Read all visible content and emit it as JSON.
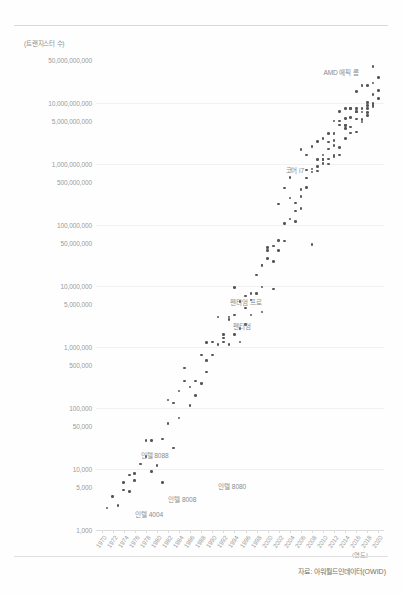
{
  "chart_data": {
    "type": "scatter",
    "title": "",
    "ylabel": "(트랜지스터 수)",
    "xlabel": "(연도)",
    "source": "자료: 아워월드인데이터(OWID)",
    "yscale": "log",
    "ylim": [
      1000,
      50000000000
    ],
    "xlim": [
      1969,
      2021
    ],
    "grid": true,
    "legend": "none",
    "ytick_labels": [
      "50,000,000,000",
      "10,000,000,000",
      "5,000,000,000",
      "1,000,000,000",
      "500,000,000",
      "100,000,000",
      "50,000,000",
      "10,000,000",
      "5,000,000",
      "1,000,000",
      "500,000",
      "100,000",
      "50,000",
      "10,000",
      "5,000",
      "1,000"
    ],
    "ytick_values": [
      50000000000,
      10000000000,
      5000000000,
      1000000000,
      500000000,
      100000000,
      50000000,
      10000000,
      5000000,
      1000000,
      500000,
      100000,
      50000,
      10000,
      5000,
      1000
    ],
    "gridline_values": [
      10000000000,
      1000000000,
      100000000,
      10000000,
      1000000,
      100000,
      10000,
      1000
    ],
    "xtick_labels": [
      "1970",
      "1972",
      "1974",
      "1976",
      "1978",
      "1980",
      "1982",
      "1984",
      "1986",
      "1988",
      "1990",
      "1992",
      "1994",
      "1996",
      "1998",
      "2000",
      "2002",
      "2004",
      "2006",
      "2008",
      "2010",
      "2012",
      "2014",
      "2016",
      "2018",
      "2020"
    ],
    "xtick_values": [
      1970,
      1972,
      1974,
      1976,
      1978,
      1980,
      1982,
      1984,
      1986,
      1988,
      1990,
      1992,
      1994,
      1996,
      1998,
      2000,
      2002,
      2004,
      2006,
      2008,
      2010,
      2012,
      2014,
      2016,
      2018,
      2020
    ],
    "annotations": [
      {
        "label": "AMD 에픽 롬",
        "x": 2019,
        "y": 32000000000,
        "align": "right",
        "dx": -14,
        "dy": 0
      },
      {
        "label": "코어 i7",
        "x": 2008,
        "y": 780000000,
        "align": "right",
        "dx": -8,
        "dy": 0
      },
      {
        "label": "펜티엄 프로",
        "x": 2000,
        "y": 5500000,
        "align": "right",
        "dx": -6,
        "dy": 0
      },
      {
        "label": "펜티엄",
        "x": 1998,
        "y": 2200000,
        "align": "right",
        "dx": -6,
        "dy": 0
      },
      {
        "label": "인텔 8088",
        "x": 1976,
        "y": 17000,
        "align": "left",
        "dx": 6,
        "dy": 0
      },
      {
        "label": "인텔 8080",
        "x": 1990,
        "y": 5200,
        "align": "left",
        "dx": 6,
        "dy": 0
      },
      {
        "label": "인텔 8008",
        "x": 1981,
        "y": 3200,
        "align": "left",
        "dx": 6,
        "dy": 0
      },
      {
        "label": "인텔 4004",
        "x": 1975,
        "y": 1800,
        "align": "left",
        "dx": 6,
        "dy": 0
      }
    ],
    "points": [
      [
        1971,
        2300
      ],
      [
        1972,
        3500
      ],
      [
        1974,
        4500
      ],
      [
        1974,
        6000
      ],
      [
        1975,
        8000
      ],
      [
        1976,
        6500
      ],
      [
        1978,
        29000
      ],
      [
        1979,
        29000
      ],
      [
        1979,
        9000
      ],
      [
        1980,
        11500
      ],
      [
        1981,
        6000
      ],
      [
        1982,
        134000
      ],
      [
        1982,
        55000
      ],
      [
        1983,
        22000
      ],
      [
        1984,
        190000
      ],
      [
        1985,
        275000
      ],
      [
        1986,
        110000
      ],
      [
        1987,
        160000
      ],
      [
        1988,
        250000
      ],
      [
        1988,
        730000
      ],
      [
        1989,
        1180000
      ],
      [
        1989,
        600000
      ],
      [
        1990,
        1200000
      ],
      [
        1991,
        1100000
      ],
      [
        1992,
        1200000
      ],
      [
        1993,
        3100000
      ],
      [
        1993,
        2800000
      ],
      [
        1994,
        1600000
      ],
      [
        1994,
        9300000
      ],
      [
        1995,
        5500000
      ],
      [
        1995,
        2000000
      ],
      [
        1996,
        4300000
      ],
      [
        1997,
        7500000
      ],
      [
        1997,
        5900000
      ],
      [
        1998,
        7500000
      ],
      [
        1999,
        9500000
      ],
      [
        1999,
        22000000
      ],
      [
        1999,
        21300000
      ],
      [
        2000,
        42000000
      ],
      [
        2000,
        28000000
      ],
      [
        2001,
        25000000
      ],
      [
        2001,
        45000000
      ],
      [
        2002,
        55000000
      ],
      [
        2002,
        220000000
      ],
      [
        2003,
        105000000
      ],
      [
        2003,
        54000000
      ],
      [
        2004,
        125000000
      ],
      [
        2004,
        592000000
      ],
      [
        2005,
        228000000
      ],
      [
        2005,
        112000000
      ],
      [
        2006,
        291000000
      ],
      [
        2006,
        184000000
      ],
      [
        2006,
        1720000000
      ],
      [
        2007,
        582000000
      ],
      [
        2007,
        410000000
      ],
      [
        2007,
        789000000
      ],
      [
        2008,
        731000000
      ],
      [
        2008,
        820000000
      ],
      [
        2008,
        47000000
      ],
      [
        2008,
        1900000000
      ],
      [
        2009,
        904000000
      ],
      [
        2009,
        2300000000
      ],
      [
        2010,
        1170000000
      ],
      [
        2010,
        1400000000
      ],
      [
        2010,
        2600000000
      ],
      [
        2010,
        1000000000
      ],
      [
        2011,
        1200000000
      ],
      [
        2011,
        2270000000
      ],
      [
        2011,
        995000000
      ],
      [
        2011,
        1750000000
      ],
      [
        2012,
        1400000000
      ],
      [
        2012,
        2400000000
      ],
      [
        2012,
        5000000000
      ],
      [
        2012,
        3100000000
      ],
      [
        2013,
        1860000000
      ],
      [
        2013,
        4310000000
      ],
      [
        2013,
        5000000000
      ],
      [
        2013,
        1400000000
      ],
      [
        2014,
        4200000000
      ],
      [
        2014,
        5560000000
      ],
      [
        2014,
        2600000000
      ],
      [
        2014,
        3800000000
      ],
      [
        2015,
        3200000000
      ],
      [
        2015,
        8000000000
      ],
      [
        2015,
        5700000000
      ],
      [
        2015,
        4000000000
      ],
      [
        2016,
        7200000000
      ],
      [
        2016,
        3300000000
      ],
      [
        2016,
        8000000000
      ],
      [
        2016,
        5400000000
      ],
      [
        2017,
        19200000000
      ],
      [
        2017,
        4800000000
      ],
      [
        2017,
        8000000000
      ],
      [
        2017,
        5300000000
      ],
      [
        2018,
        10000000000
      ],
      [
        2018,
        6900000000
      ],
      [
        2018,
        6100000000
      ],
      [
        2018,
        19200000000
      ],
      [
        2019,
        39540000000
      ],
      [
        2019,
        8500000000
      ],
      [
        2019,
        9700000000
      ],
      [
        2019,
        13500000000
      ],
      [
        2020,
        11800000000
      ],
      [
        2020,
        16000000000
      ],
      [
        1997,
        3300000
      ],
      [
        1996,
        2300000
      ],
      [
        1995,
        1200000
      ],
      [
        1993,
        1100000
      ],
      [
        1991,
        3100000
      ],
      [
        1990,
        730000
      ],
      [
        1987,
        275000
      ],
      [
        1985,
        450000
      ],
      [
        1983,
        120000
      ],
      [
        1981,
        31000
      ],
      [
        1978,
        16000
      ],
      [
        1977,
        12000
      ],
      [
        1976,
        8500
      ],
      [
        1975,
        4300
      ],
      [
        1973,
        2500
      ],
      [
        1984,
        68000
      ],
      [
        1986,
        220000
      ],
      [
        1989,
        390000
      ],
      [
        1992,
        1600000
      ],
      [
        1998,
        15000000
      ],
      [
        2000,
        37500000
      ],
      [
        2002,
        37500000
      ],
      [
        2004,
        276000000
      ],
      [
        2006,
        376000000
      ],
      [
        2009,
        1170000000
      ],
      [
        2011,
        3100000000
      ],
      [
        2013,
        7100000000
      ],
      [
        2015,
        8100000000
      ],
      [
        2017,
        7000000000
      ],
      [
        2019,
        21100000000
      ],
      [
        2005,
        169000000
      ],
      [
        2003,
        400000000
      ],
      [
        2007,
        1400000000
      ],
      [
        2009,
        758000000
      ],
      [
        2012,
        1300000000
      ],
      [
        2014,
        8000000000
      ],
      [
        2016,
        15300000000
      ],
      [
        2018,
        9000000000
      ],
      [
        2020,
        26000000000
      ],
      [
        2019,
        9000000000
      ],
      [
        1999,
        3700000
      ],
      [
        2001,
        8800000
      ],
      [
        1996,
        6800000
      ],
      [
        1994,
        3300000
      ],
      [
        1992,
        1400000
      ],
      [
        2010,
        1170000000
      ],
      [
        2012,
        2000000000
      ],
      [
        2014,
        4310000000
      ],
      [
        2016,
        7000000000
      ],
      [
        2018,
        8000000000
      ]
    ]
  }
}
